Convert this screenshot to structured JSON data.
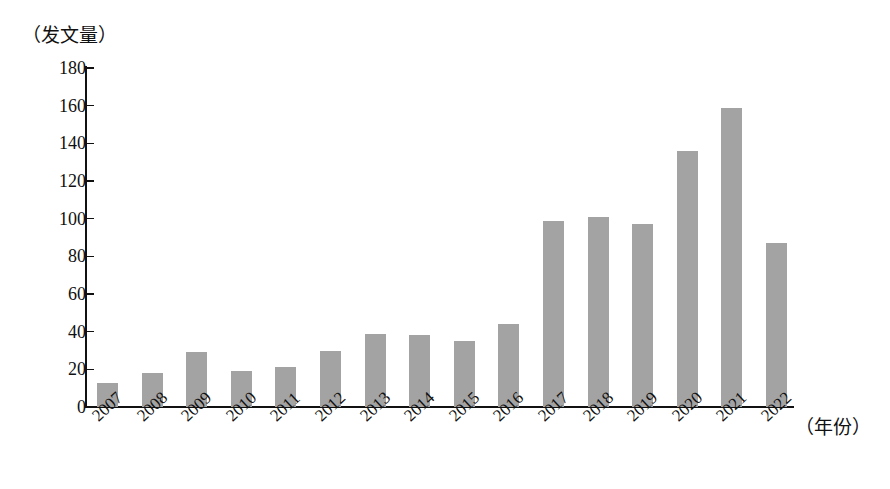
{
  "chart_data": {
    "type": "bar",
    "title": "",
    "subtitle": "",
    "ylabel": "（发文量）",
    "xlabel": "（年份）",
    "categories": [
      "2007",
      "2008",
      "2009",
      "2010",
      "2011",
      "2012",
      "2013",
      "2014",
      "2015",
      "2016",
      "2017",
      "2018",
      "2019",
      "2020",
      "2021",
      "2022"
    ],
    "values": [
      13,
      18,
      29,
      19,
      21,
      30,
      39,
      38,
      35,
      44,
      99,
      101,
      97,
      136,
      159,
      87
    ],
    "ylim": [
      0,
      180
    ],
    "y_ticks": [
      0,
      20,
      40,
      60,
      80,
      100,
      120,
      140,
      160,
      180
    ],
    "y_tick_labels": [
      "0",
      "20",
      "40",
      "60",
      "80",
      "100",
      "120",
      "140",
      "160",
      "180"
    ],
    "grid": false,
    "legend": null,
    "legend_position": "none",
    "bar_color": "#a3a3a3",
    "axis_color": "#111111"
  }
}
